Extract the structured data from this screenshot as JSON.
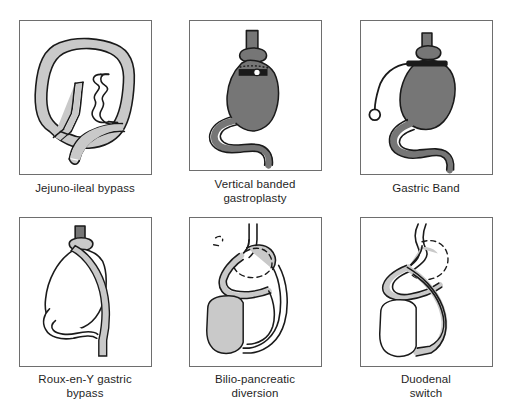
{
  "figure": {
    "type": "medical-illustration-grid",
    "rows": 2,
    "columns": 3,
    "style": {
      "background_color": "#ffffff",
      "panel_border_color": "#6e6e6e",
      "outline_color": "#1a1a1a",
      "dark_fill_color": "#767676",
      "light_fill_color": "#c9c9c9",
      "white_fill_color": "#ffffff"
    },
    "panels": [
      {
        "id": "jejuno-ileal-bypass",
        "caption": "Jejuno-ileal bypass",
        "caption_lines": 1,
        "fill": "light-stipple",
        "description": "Large looped small bowel outline with stippled light gray fill; bypassed intestinal segment drawn as an internal zig-zag tube, anastomosis marked at lower left."
      },
      {
        "id": "vertical-banded-gastroplasty",
        "caption": "Vertical banded\ngastroplasty",
        "caption_lines": 2,
        "fill": "dark-solid",
        "description": "Dark gray filled stomach with esophagus entering at top, a horizontal band with stoma just below the cardia, and duodenum curving down to the lower right."
      },
      {
        "id": "gastric-band",
        "caption": "Gastric Band",
        "caption_lines": 1,
        "fill": "dark-solid",
        "description": "Dark gray filled stomach with an adjustable band at the top and a thin connecting tube curving to the left ending in a small circular access port."
      },
      {
        "id": "roux-en-y-gastric-bypass",
        "caption": "Roux-en-Y gastric\nbypass",
        "caption_lines": 2,
        "fill": "white-outline",
        "description": "White outlined stomach with a small upper pouch; a light gray Roux limb descends across the stomach from the gastrojejunostomy to the lower right."
      },
      {
        "id": "bilio-pancreatic-diversion",
        "caption": "Bilio-pancreatic\ndiversion",
        "caption_lines": 2,
        "fill": "mixed",
        "description": "Dashed outline shows the resected distal stomach; gray alimentary and biliopancreatic limbs run down the right side to a shaded gray bowel remnant at lower left."
      },
      {
        "id": "duodenal-switch",
        "caption": "Duodenal\nswitch",
        "caption_lines": 2,
        "fill": "mixed",
        "description": "Sleeve gastrectomy with dashed line marking the removed greater curvature; duodenal limbs cross downward to a white bowel pouch at lower left."
      }
    ]
  }
}
